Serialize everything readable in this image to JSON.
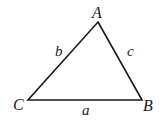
{
  "diagram": {
    "type": "triangle",
    "stroke_color": "#1a1a1a",
    "background": "#ffffff",
    "vertices": [
      {
        "label": "A",
        "x": 98,
        "y": 22,
        "label_x": 92,
        "label_y": 18
      },
      {
        "label": "B",
        "x": 142,
        "y": 100,
        "label_x": 143,
        "label_y": 111
      },
      {
        "label": "C",
        "x": 28,
        "y": 100,
        "label_x": 13,
        "label_y": 110
      }
    ],
    "sides": [
      {
        "label": "a",
        "between": [
          "C",
          "B"
        ],
        "label_x": 82,
        "label_y": 115
      },
      {
        "label": "b",
        "between": [
          "C",
          "A"
        ],
        "label_x": 55,
        "label_y": 56
      },
      {
        "label": "c",
        "between": [
          "A",
          "B"
        ],
        "label_x": 127,
        "label_y": 56
      }
    ]
  }
}
